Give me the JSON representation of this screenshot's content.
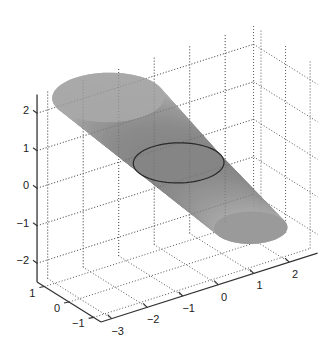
{
  "chart_data": {
    "type": "surface3d",
    "title": "",
    "xlabel": "",
    "ylabel": "",
    "zlabel": "",
    "xlim": [
      -3.3,
      2.8
    ],
    "ylim": [
      -1.3,
      1.3
    ],
    "zlim": [
      -2.5,
      2.5
    ],
    "grid": true,
    "grid_style": "dotted",
    "xticks": [
      -3,
      -2,
      -1,
      0,
      1,
      2
    ],
    "yticks": [
      -1,
      0,
      1
    ],
    "zticks": [
      -2,
      -1,
      0,
      1,
      2
    ],
    "xtick_labels": [
      "−3",
      "−2",
      "−1",
      "0",
      "1",
      "2"
    ],
    "ytick_labels": [
      "−1",
      "0",
      "1"
    ],
    "ztick_labels": [
      "−2",
      "−1",
      "0",
      "1",
      "2"
    ],
    "surface": {
      "description": "tilted conical tube with circular cross-sections",
      "cross_sections": [
        {
          "name": "top-cap",
          "center": [
            -1.5,
            1.0,
            2.0
          ],
          "radius": 1.3,
          "outlined": false
        },
        {
          "name": "middle-section",
          "center": [
            0.1,
            0.45,
            0.0
          ],
          "radius": 1.05,
          "outlined": true
        },
        {
          "name": "bottom-cap",
          "center": [
            1.75,
            -0.1,
            -2.0
          ],
          "radius": 0.85,
          "outlined": false
        }
      ],
      "colormap": "gray"
    },
    "colors": {
      "axis": "#333333",
      "grid": "#555555",
      "cap_top": "#a8a8a8",
      "cap_middle": "#858585",
      "cap_bottom": "#999999",
      "body_light": "#c8c8c8",
      "body_dark": "#6e6e6e"
    }
  }
}
